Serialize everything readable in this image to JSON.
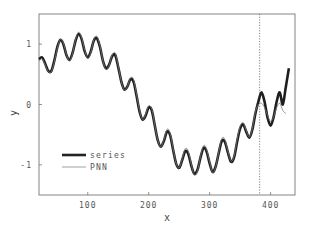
{
  "chart_data": {
    "type": "line",
    "title": "",
    "xlabel": "x",
    "ylabel": "y",
    "xlim": [
      20,
      440
    ],
    "ylim": [
      -1.5,
      1.5
    ],
    "xticks": [
      100,
      200,
      300,
      400
    ],
    "yticks": [
      -1,
      0,
      1
    ],
    "xtick_labels": [
      "100",
      "200",
      "300",
      "400"
    ],
    "ytick_labels": [
      "-1",
      "0",
      "1"
    ],
    "grid": false,
    "legend_position": "lower left",
    "vertical_marker": {
      "x": 382,
      "style": "dotted"
    },
    "legend": [
      "series",
      "PNN"
    ],
    "series": [
      {
        "name": "series",
        "style": "thick solid",
        "x": [
          20,
          25,
          30,
          35,
          40,
          45,
          50,
          55,
          60,
          65,
          70,
          75,
          80,
          85,
          90,
          95,
          100,
          105,
          110,
          115,
          120,
          125,
          130,
          135,
          140,
          145,
          150,
          155,
          160,
          165,
          170,
          175,
          180,
          185,
          190,
          195,
          200,
          205,
          210,
          215,
          220,
          225,
          230,
          235,
          240,
          245,
          250,
          255,
          260,
          265,
          270,
          275,
          280,
          285,
          290,
          295,
          300,
          305,
          310,
          315,
          320,
          325,
          330,
          335,
          340,
          345,
          350,
          355,
          360,
          365,
          370,
          375,
          380,
          385,
          390,
          395,
          400,
          405,
          410,
          415,
          420,
          425,
          430
        ],
        "values": [
          0.75,
          0.78,
          0.68,
          0.56,
          0.55,
          0.72,
          0.95,
          1.07,
          1.0,
          0.82,
          0.74,
          0.85,
          1.06,
          1.17,
          1.08,
          0.88,
          0.78,
          0.88,
          1.06,
          1.1,
          0.95,
          0.72,
          0.6,
          0.66,
          0.8,
          0.82,
          0.62,
          0.38,
          0.25,
          0.3,
          0.42,
          0.38,
          0.15,
          -0.12,
          -0.25,
          -0.18,
          -0.05,
          -0.1,
          -0.35,
          -0.6,
          -0.7,
          -0.6,
          -0.45,
          -0.5,
          -0.75,
          -0.98,
          -1.05,
          -0.92,
          -0.77,
          -0.82,
          -1.02,
          -1.15,
          -1.08,
          -0.88,
          -0.72,
          -0.78,
          -0.98,
          -1.12,
          -1.02,
          -0.8,
          -0.6,
          -0.62,
          -0.8,
          -0.95,
          -0.88,
          -0.62,
          -0.4,
          -0.33,
          -0.45,
          -0.55,
          -0.42,
          -0.15,
          0.05,
          0.2,
          0.05,
          -0.22,
          -0.35,
          -0.2,
          0.05,
          0.2,
          0.0,
          0.3,
          0.6
        ]
      },
      {
        "name": "PNN",
        "style": "thin solid",
        "x": [
          20,
          25,
          30,
          35,
          40,
          45,
          50,
          55,
          60,
          65,
          70,
          75,
          80,
          85,
          90,
          95,
          100,
          105,
          110,
          115,
          120,
          125,
          130,
          135,
          140,
          145,
          150,
          155,
          160,
          165,
          170,
          175,
          180,
          185,
          190,
          195,
          200,
          205,
          210,
          215,
          220,
          225,
          230,
          235,
          240,
          245,
          250,
          255,
          260,
          265,
          270,
          275,
          280,
          285,
          290,
          295,
          300,
          305,
          310,
          315,
          320,
          325,
          330,
          335,
          340,
          345,
          350,
          355,
          360,
          365,
          370,
          375,
          380,
          385,
          390,
          395,
          400,
          405,
          410,
          415,
          420,
          425
        ],
        "values": [
          0.72,
          0.76,
          0.66,
          0.55,
          0.54,
          0.7,
          0.93,
          1.08,
          1.02,
          0.83,
          0.72,
          0.84,
          1.08,
          1.2,
          1.1,
          0.9,
          0.76,
          0.86,
          1.08,
          1.13,
          0.97,
          0.72,
          0.58,
          0.65,
          0.82,
          0.85,
          0.64,
          0.38,
          0.24,
          0.3,
          0.44,
          0.42,
          0.17,
          -0.1,
          -0.25,
          -0.16,
          -0.02,
          -0.08,
          -0.34,
          -0.6,
          -0.7,
          -0.58,
          -0.41,
          -0.47,
          -0.73,
          -0.98,
          -1.05,
          -0.9,
          -0.73,
          -0.78,
          -1.0,
          -1.17,
          -1.1,
          -0.86,
          -0.68,
          -0.74,
          -0.96,
          -1.13,
          -1.03,
          -0.78,
          -0.56,
          -0.58,
          -0.78,
          -0.94,
          -0.86,
          -0.58,
          -0.36,
          -0.3,
          -0.43,
          -0.54,
          -0.4,
          -0.12,
          0.0,
          0.02,
          -0.05,
          -0.18,
          -0.28,
          -0.2,
          -0.05,
          0.02,
          -0.1,
          -0.15
        ]
      }
    ]
  }
}
